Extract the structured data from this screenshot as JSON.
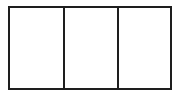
{
  "diagram": {
    "shape": "rectangle",
    "panels": [
      {
        "label": ""
      },
      {
        "label": ""
      },
      {
        "label": ""
      }
    ],
    "panel_count": 3,
    "stroke_color": "#1e1e1e",
    "fill_color": "#ffffff"
  }
}
